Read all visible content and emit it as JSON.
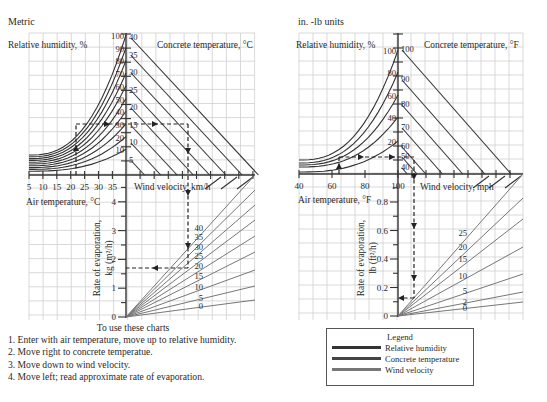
{
  "metric": {
    "title": "Metric",
    "rh_label": "Relative humidity, %",
    "ct_label": "Concrete temperature, °C",
    "air_label": "Air temperature, °C",
    "wind_label": "Wind velocity, km/h",
    "evap_label_1": "Rate of evaporation,",
    "evap_label_2": "kg (m²/h)",
    "air_ticks": [
      "5",
      "10",
      "15",
      "20",
      "25",
      "30",
      "35"
    ],
    "rh_values": [
      "100",
      "90",
      "80",
      "70",
      "60",
      "50",
      "40",
      "30",
      "20",
      "10"
    ],
    "ct_values": [
      "40",
      "35",
      "30",
      "25",
      "20",
      "15",
      "10",
      "5"
    ],
    "wind_values": [
      "40",
      "35",
      "30",
      "25",
      "20",
      "15",
      "10",
      "5",
      "0"
    ],
    "evap_ticks": [
      "0",
      "1",
      "2",
      "3",
      "4"
    ]
  },
  "imperial": {
    "title": "in. -lb units",
    "rh_label": "Relative humidity, %",
    "ct_label": "Concrete temperature, °F",
    "air_label": "Air temperature, °F",
    "wind_label": "Wind velocity, mph",
    "evap_label_1": "Rate of evaporation,",
    "evap_label_2": "lb (ft²/h)",
    "air_ticks": [
      "40",
      "60",
      "80",
      "100"
    ],
    "rh_values": [
      "100",
      "80",
      "60",
      "40",
      "20"
    ],
    "ct_values": [
      "100",
      "90",
      "80",
      "70",
      "60",
      "50",
      "40"
    ],
    "wind_values": [
      "25",
      "20",
      "15",
      "10",
      "5",
      "2",
      "0"
    ],
    "evap_ticks": [
      "0",
      "0.2",
      "0.4",
      "0.6",
      "0.8"
    ]
  },
  "instructions": {
    "heading": "To use these charts",
    "steps": [
      "1. Enter with air temperature, move up to relative humidity.",
      "2. Move right to concrete temperatue.",
      "3. Move down to wind velocity.",
      "4. Move left; read approximate rate of evaporation."
    ]
  },
  "legend": {
    "title": "Legend",
    "items": [
      {
        "label": "Relative humidity",
        "color": "#333333"
      },
      {
        "label": "Concrete temperature",
        "color": "#444444"
      },
      {
        "label": "Wind velocity",
        "color": "#777777"
      }
    ]
  },
  "chart_data": [
    {
      "type": "line",
      "title": "Metric",
      "xlabel": "Air temperature, °C",
      "ylabel": "Rate of evaporation, kg (m²/h)",
      "quadrants": [
        "Relative humidity, %",
        "Concrete temperature, °C",
        "Wind velocity, km/h",
        "Rate of evaporation"
      ],
      "air_temperature_ticks": [
        5,
        10,
        15,
        20,
        25,
        30,
        35
      ],
      "relative_humidity_curves": [
        100,
        90,
        80,
        70,
        60,
        50,
        40,
        30,
        20,
        10
      ],
      "concrete_temperature_lines": [
        40,
        35,
        30,
        25,
        20,
        15,
        10,
        5
      ],
      "wind_velocity_lines": [
        40,
        35,
        30,
        25,
        20,
        15,
        10,
        5,
        0
      ],
      "evaporation_ticks": [
        0,
        1,
        2,
        3,
        4
      ],
      "ylim": [
        0,
        4.5
      ],
      "grid": true,
      "example_path": {
        "air_temperature": 22,
        "relative_humidity": 40,
        "concrete_temperature": 25,
        "wind_velocity": 20,
        "evaporation_rate": 1.7
      }
    },
    {
      "type": "line",
      "title": "in. -lb units",
      "xlabel": "Air temperature, °F",
      "ylabel": "Rate of evaporation, lb (ft²/h)",
      "quadrants": [
        "Relative humidity, %",
        "Concrete temperature, °F",
        "Wind velocity, mph",
        "Rate of evaporation"
      ],
      "air_temperature_ticks": [
        40,
        60,
        80,
        100
      ],
      "relative_humidity_curves": [
        100,
        80,
        60,
        40,
        20
      ],
      "concrete_temperature_lines": [
        100,
        90,
        80,
        70,
        60,
        50,
        40
      ],
      "wind_velocity_lines": [
        25,
        20,
        15,
        10,
        5,
        2,
        0
      ],
      "evaporation_ticks": [
        0,
        0.2,
        0.4,
        0.6,
        0.8
      ],
      "ylim": [
        0,
        0.9
      ],
      "grid": true,
      "example_path": {
        "air_temperature": 65,
        "relative_humidity": 20,
        "concrete_temperature": 50,
        "wind_velocity": 10,
        "evaporation_rate": 0.12
      }
    }
  ]
}
